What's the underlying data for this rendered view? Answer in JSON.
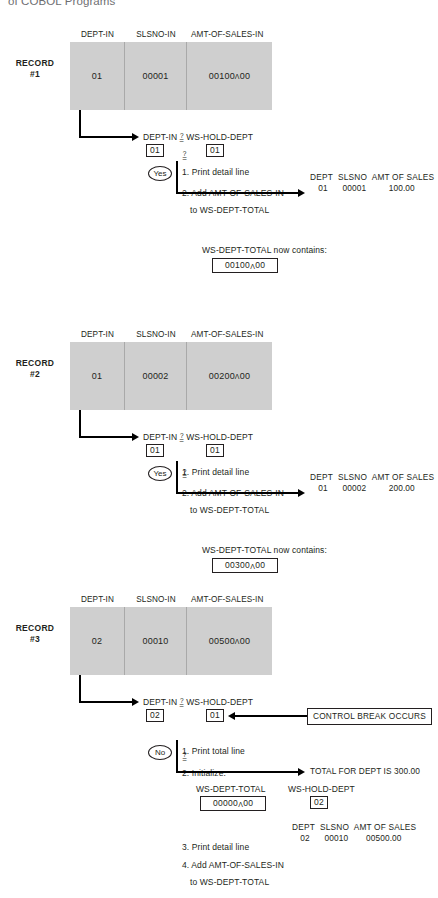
{
  "page": {
    "running_header": "of COBOL Programs"
  },
  "labels": {
    "col_dept": "DEPT-IN",
    "col_slsno": "SLSNO-IN",
    "col_amt": "AMT-OF-SALES-IN",
    "compare_left": "DEPT-IN",
    "compare_right": "WS-HOLD-DEPT",
    "compare_op_question": "?",
    "compare_op_equals": "=",
    "yes": "Yes",
    "no": "No",
    "ws_dept_total": "WS-DEPT-TOTAL",
    "ws_hold_dept": "WS-HOLD-DEPT",
    "total_now_contains": "WS-DEPT-TOTAL now contains:",
    "control_break": "CONTROL BREAK OCCURS",
    "report_hdr_dept": "DEPT",
    "report_hdr_slsno": "SLSNO",
    "report_hdr_amt": "AMT OF SALES"
  },
  "records": [
    {
      "record_label_line1": "RECORD",
      "record_label_line2": "#1",
      "dept_in": "01",
      "slsno_in": "00001",
      "amt_of_sales_in": "00100",
      "amt_of_sales_in_decimals": "00",
      "compare_left_value": "01",
      "compare_right_value": "01",
      "branch": "Yes",
      "steps": [
        "1. Print detail line",
        "2. Add AMT-OF-SALES-IN",
        "to WS-DEPT-TOTAL"
      ],
      "report": {
        "dept": "01",
        "slsno": "00001",
        "amt": "100.00"
      },
      "total_note": "WS-DEPT-TOTAL now contains:",
      "total_value": "00100",
      "total_value_decimals": "00"
    },
    {
      "record_label_line1": "RECORD",
      "record_label_line2": "#2",
      "dept_in": "01",
      "slsno_in": "00002",
      "amt_of_sales_in": "00200",
      "amt_of_sales_in_decimals": "00",
      "compare_left_value": "01",
      "compare_right_value": "01",
      "branch": "Yes",
      "steps": [
        "1. Print detail line",
        "2. Add AMT-OF-SALES-IN",
        "to WS-DEPT-TOTAL"
      ],
      "report": {
        "dept": "01",
        "slsno": "00002",
        "amt": "200.00"
      },
      "total_note": "WS-DEPT-TOTAL now contains:",
      "total_value": "00300",
      "total_value_decimals": "00"
    },
    {
      "record_label_line1": "RECORD",
      "record_label_line2": "#3",
      "dept_in": "02",
      "slsno_in": "00010",
      "amt_of_sales_in": "00500",
      "amt_of_sales_in_decimals": "00",
      "compare_left_value": "02",
      "compare_right_value": "01",
      "branch": "No",
      "annotation": "CONTROL BREAK OCCURS",
      "steps": [
        "1. Print total line",
        "2. Initialize:",
        "3. Print detail line",
        "4. Add AMT-OF-SALES-IN",
        "to WS-DEPT-TOTAL"
      ],
      "total_line": "TOTAL FOR DEPT IS 300.00",
      "init_total_label": "WS-DEPT-TOTAL",
      "init_total_value": "00000",
      "init_total_decimals": "00",
      "init_hold_label": "WS-HOLD-DEPT",
      "init_hold_value": "02",
      "report": {
        "dept": "02",
        "slsno": "00010",
        "amt": "00500.00"
      }
    }
  ]
}
